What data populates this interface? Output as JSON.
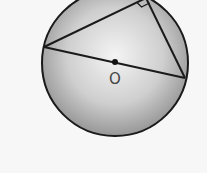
{
  "diagram": {
    "type": "geometry",
    "center_label": "O",
    "colors": {
      "background": "#f7f7f7",
      "circle_edge": "#1a1a1a",
      "circle_fill_center": "#f2f2f2",
      "circle_fill_edge": "#9a9a9a",
      "lines": "#1a1a1a"
    },
    "circle": {
      "cx": 115,
      "cy": 63,
      "r": 73
    },
    "points": {
      "left": {
        "x": 44,
        "y": 47
      },
      "right": {
        "x": 185,
        "y": 78
      },
      "top": {
        "x": 146,
        "y": -2
      },
      "center": {
        "x": 115,
        "y": 62
      }
    },
    "right_angle_marker": true
  }
}
